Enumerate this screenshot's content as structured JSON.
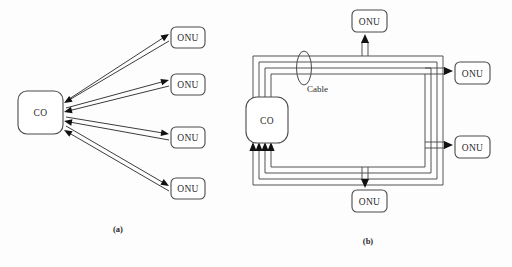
{
  "figure": {
    "width": 512,
    "height": 267,
    "background": "#fdfdfd",
    "line_color": "#4a4a4a",
    "arrow_color": "#111111",
    "text_color": "#2b2b2b"
  },
  "panel_a": {
    "caption": "(a)",
    "caption_x": 118,
    "caption_y": 229,
    "hub": {
      "label": "CO",
      "x": 18,
      "y": 91,
      "width": 45,
      "height": 43,
      "radius": 9,
      "cx": 40.5,
      "cy": 112.5
    },
    "nodes": [
      {
        "label": "ONU",
        "x": 171,
        "y": 27,
        "width": 34,
        "height": 21,
        "radius": 5
      },
      {
        "label": "ONU",
        "x": 171,
        "y": 74,
        "width": 34,
        "height": 21,
        "radius": 5
      },
      {
        "label": "ONU",
        "x": 171,
        "y": 127,
        "width": 34,
        "height": 21,
        "radius": 5
      },
      {
        "label": "ONU",
        "x": 171,
        "y": 178,
        "width": 34,
        "height": 21,
        "radius": 5
      }
    ],
    "links": [
      {
        "name": "co-to-onu-1",
        "outbound": {
          "x1": 66,
          "y1": 101,
          "x2": 169,
          "y2": 34
        },
        "inbound": {
          "x1": 169,
          "y1": 41,
          "x2": 64,
          "y2": 103
        }
      },
      {
        "name": "co-to-onu-2",
        "outbound": {
          "x1": 66,
          "y1": 108,
          "x2": 169,
          "y2": 80
        },
        "inbound": {
          "x1": 169,
          "y1": 86,
          "x2": 64,
          "y2": 112
        }
      },
      {
        "name": "co-to-onu-3",
        "outbound": {
          "x1": 66,
          "y1": 117,
          "x2": 169,
          "y2": 134
        },
        "inbound": {
          "x1": 169,
          "y1": 140,
          "x2": 64,
          "y2": 121
        }
      },
      {
        "name": "co-to-onu-4",
        "outbound": {
          "x1": 66,
          "y1": 126,
          "x2": 169,
          "y2": 186
        },
        "inbound": {
          "x1": 169,
          "y1": 191,
          "x2": 64,
          "y2": 130
        }
      }
    ]
  },
  "panel_b": {
    "caption": "(b)",
    "caption_x": 368,
    "caption_y": 241,
    "cable": {
      "label": "Cable",
      "label_x": 307,
      "label_y": 89,
      "ellipse_cx": 304,
      "ellipse_cy": 68,
      "ellipse_rx": 7.5,
      "ellipse_ry": 17
    },
    "hub": {
      "label": "CO",
      "x": 246,
      "y": 97,
      "width": 42,
      "height": 46,
      "radius": 11,
      "cx": 267,
      "cy": 120
    },
    "nodes": [
      {
        "name": "onu-top",
        "label": "ONU",
        "x": 352,
        "y": 10,
        "width": 35,
        "height": 22,
        "radius": 5
      },
      {
        "name": "onu-right-1",
        "label": "ONU",
        "x": 455,
        "y": 62,
        "width": 35,
        "height": 22,
        "radius": 5
      },
      {
        "name": "onu-right-2",
        "label": "ONU",
        "x": 455,
        "y": 136,
        "width": 35,
        "height": 22,
        "radius": 5
      },
      {
        "name": "onu-bottom",
        "label": "ONU",
        "x": 352,
        "y": 190,
        "width": 35,
        "height": 22,
        "radius": 5
      }
    ],
    "rings": [
      {
        "name": "ring-outer-1",
        "top": 56,
        "bottom": 185,
        "left": 253,
        "right": 443,
        "up_x": 253,
        "down_x": 253
      },
      {
        "name": "ring-outer-2",
        "top": 62,
        "bottom": 179,
        "left": 259,
        "right": 437,
        "up_x": 259,
        "down_x": 259
      },
      {
        "name": "ring-outer-3",
        "top": 68,
        "bottom": 173,
        "left": 265,
        "right": 431,
        "up_x": 265,
        "down_x": 265
      },
      {
        "name": "ring-outer-4",
        "top": 74,
        "bottom": 167,
        "left": 271,
        "right": 425,
        "up_x": 271,
        "down_x": 271
      }
    ],
    "drops": [
      {
        "name": "drop-top",
        "direction": "up",
        "x1": 362,
        "x2": 368,
        "from_y": 56,
        "to_y": 34
      },
      {
        "name": "drop-right-1",
        "direction": "right",
        "y1": 68,
        "y2": 74,
        "from_x": 425,
        "to_x": 453
      },
      {
        "name": "drop-right-2",
        "direction": "right",
        "y1": 142,
        "y2": 148,
        "from_x": 425,
        "to_x": 453
      },
      {
        "name": "drop-bottom",
        "direction": "down",
        "x1": 362,
        "x2": 368,
        "from_y": 167,
        "to_y": 188
      }
    ],
    "hub_inputs": [
      {
        "name": "co-input-1",
        "x": 253
      },
      {
        "name": "co-input-2",
        "x": 259
      },
      {
        "name": "co-input-3",
        "x": 265
      },
      {
        "name": "co-input-4",
        "x": 271
      }
    ],
    "hub_input_y": 145
  }
}
